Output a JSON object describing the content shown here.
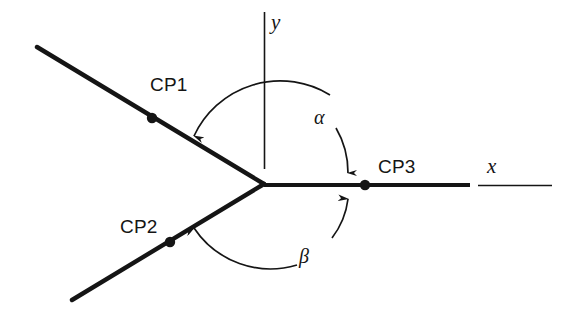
{
  "figure": {
    "background_color": "#ffffff",
    "stroke_color": "#151515",
    "canvas": {
      "width": 575,
      "height": 314
    }
  },
  "axes": {
    "y_axis": {
      "label": "y",
      "label_x": 271,
      "label_y": 12,
      "style": "thin-line"
    },
    "x_axis": {
      "label": "x",
      "label_x": 487,
      "label_y": 156,
      "style": "thick-then-thin-line"
    }
  },
  "points": [
    {
      "name": "CP1",
      "label": "CP1",
      "label_x": 150,
      "label_y": 75,
      "dot_x": 152,
      "dot_y": 118
    },
    {
      "name": "CP2",
      "label": "CP2",
      "label_x": 120,
      "label_y": 217,
      "dot_x": 170,
      "dot_y": 242
    },
    {
      "name": "CP3",
      "label": "CP3",
      "label_x": 378,
      "label_y": 157,
      "dot_x": 365,
      "dot_y": 185
    }
  ],
  "angles": [
    {
      "name": "alpha",
      "label": "α",
      "label_x": 314,
      "label_y": 107,
      "description": "angle measured counterclockwise from the positive x-axis to the upper-left ray"
    },
    {
      "name": "beta",
      "label": "β",
      "label_x": 299,
      "label_y": 246,
      "description": "angle measured clockwise from the positive x-axis to the lower-left ray"
    }
  ],
  "rays": [
    {
      "name": "upper-left-ray",
      "from": [
        264,
        184
      ],
      "to": [
        37,
        47
      ]
    },
    {
      "name": "lower-left-ray",
      "from": [
        264,
        184
      ],
      "to": [
        72,
        300
      ]
    },
    {
      "name": "x-axis-ray",
      "from": [
        264,
        185
      ],
      "to": [
        470,
        185
      ]
    }
  ]
}
